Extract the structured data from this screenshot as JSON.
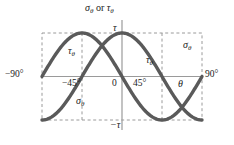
{
  "figure": {
    "title_sigma": "σ",
    "title_sigma_sub": "θ",
    "title_or": " or ",
    "title_tau": "τ",
    "title_tau_sub": "θ",
    "axis_label_theta": "θ",
    "y_top_label": "τ",
    "y_bottom_label": "−τ",
    "x_left_label": "−90°",
    "x_right_label": "90°",
    "tick_minus45": "−45°",
    "tick_zero": "0",
    "tick_plus45": "45°",
    "curve_label_tau_left": "τ",
    "curve_label_tau_left_sub": "θ",
    "curve_label_tau_mid": "τ",
    "curve_label_tau_mid_sub": "θ",
    "curve_label_sigma_right": "σ",
    "curve_label_sigma_right_sub": "θ",
    "curve_label_sigma_low": "σ",
    "curve_label_sigma_low_sub": "θ",
    "colors": {
      "curve": "#5a5a5a",
      "axis": "#8a8a8a",
      "dashed": "#9a9a9a",
      "text": "#1a1a1a",
      "background": "#ffffff"
    }
  },
  "chart_data": {
    "type": "line",
    "title": "σθ or τθ",
    "xlabel": "θ",
    "ylabel": "σθ or τθ",
    "xlim": [
      -90,
      90
    ],
    "ylim": [
      -1,
      1
    ],
    "xticks": [
      -90,
      -45,
      0,
      45,
      90
    ],
    "xticklabels": [
      "−90°",
      "−45°",
      "0",
      "45°",
      "90°"
    ],
    "yticks": [
      -1,
      0,
      1
    ],
    "yticklabels": [
      "−τ",
      "",
      "τ"
    ],
    "grid": false,
    "dashed_guides": {
      "vertical_x": [
        -90,
        -45,
        45,
        90
      ],
      "horizontal_y": [
        -1,
        1
      ]
    },
    "legend_position": "inline-annotations",
    "series": [
      {
        "name": "τθ",
        "formula": "tau*cos(2*theta)",
        "x": [
          -90,
          -80,
          -70,
          -60,
          -50,
          -45,
          -40,
          -30,
          -20,
          -10,
          0,
          10,
          20,
          30,
          40,
          45,
          50,
          60,
          70,
          80,
          90
        ],
        "values": [
          -1.0,
          -0.94,
          -0.766,
          -0.5,
          -0.174,
          0.0,
          0.174,
          0.5,
          0.766,
          0.94,
          1.0,
          0.94,
          0.766,
          0.5,
          0.174,
          0.0,
          -0.174,
          -0.5,
          -0.766,
          -0.94,
          -1.0
        ]
      },
      {
        "name": "σθ",
        "formula": "-tau*sin(2*theta)",
        "x": [
          -90,
          -80,
          -70,
          -60,
          -50,
          -45,
          -40,
          -30,
          -20,
          -10,
          0,
          10,
          20,
          30,
          40,
          45,
          50,
          60,
          70,
          80,
          90
        ],
        "values": [
          0.0,
          -0.342,
          -0.643,
          -0.866,
          -0.985,
          -1.0,
          -0.985,
          -0.866,
          -0.643,
          -0.342,
          0.0,
          0.342,
          0.643,
          0.866,
          0.985,
          1.0,
          0.985,
          0.866,
          0.643,
          0.342,
          0.0
        ]
      }
    ],
    "annotations": [
      {
        "text": "τθ",
        "x": -52,
        "y": 0.62
      },
      {
        "text": "τθ",
        "x": 26,
        "y": 0.48
      },
      {
        "text": "σθ",
        "x": 68,
        "y": 0.78
      },
      {
        "text": "σθ",
        "x": -42,
        "y": -0.55
      }
    ]
  }
}
